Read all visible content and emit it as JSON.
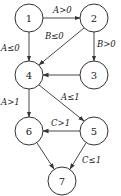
{
  "diagram": {
    "type": "flow-graph",
    "nodes": [
      {
        "id": "1",
        "label": "1",
        "x": 29,
        "y": 18
      },
      {
        "id": "2",
        "label": "2",
        "x": 94,
        "y": 18
      },
      {
        "id": "3",
        "label": "3",
        "x": 94,
        "y": 75
      },
      {
        "id": "4",
        "label": "4",
        "x": 29,
        "y": 75
      },
      {
        "id": "5",
        "label": "5",
        "x": 94,
        "y": 131
      },
      {
        "id": "6",
        "label": "6",
        "x": 29,
        "y": 131
      },
      {
        "id": "7",
        "label": "7",
        "x": 62,
        "y": 181
      }
    ],
    "edges": [
      {
        "from": "1",
        "to": "2",
        "label": "A>0"
      },
      {
        "from": "1",
        "to": "4",
        "label": "A≤0"
      },
      {
        "from": "2",
        "to": "4",
        "label": "B≤0"
      },
      {
        "from": "2",
        "to": "3",
        "label": "B>0"
      },
      {
        "from": "3",
        "to": "4",
        "label": ""
      },
      {
        "from": "4",
        "to": "6",
        "label": "A>1"
      },
      {
        "from": "4",
        "to": "5",
        "label": "A≤1"
      },
      {
        "from": "5",
        "to": "6",
        "label": "C>1"
      },
      {
        "from": "5",
        "to": "7",
        "label": "C≤1"
      },
      {
        "from": "6",
        "to": "7",
        "label": ""
      }
    ]
  }
}
